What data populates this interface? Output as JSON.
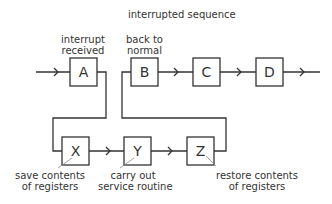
{
  "title": "interrupted sequence",
  "top_labels": {
    "interrupt_received": [
      "interrupt",
      "received"
    ],
    "back_to_normal": [
      "back to",
      "normal"
    ]
  },
  "boxes": {
    "main": [
      "A",
      "B",
      "C",
      "D"
    ],
    "service": [
      "X",
      "Y",
      "Z"
    ]
  },
  "bottom_labels": {
    "save": [
      "save contents",
      "of registers"
    ],
    "carry": [
      "carry out",
      "service routine"
    ],
    "restore": [
      "restore contents",
      "of registers"
    ]
  },
  "colors": {
    "line": "#333333",
    "text": "#333333",
    "background": "#ffffff"
  }
}
